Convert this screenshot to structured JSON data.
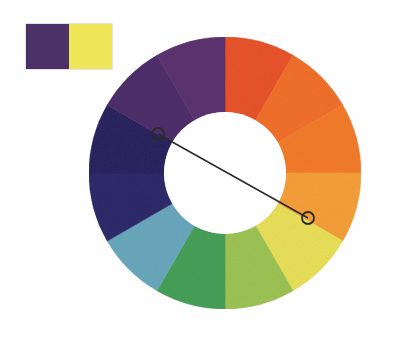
{
  "diagram": {
    "type": "color-wheel-complementary-scheme",
    "background_color": "#fefefe"
  },
  "swatch_pair": {
    "label": "complementary pair swatch",
    "colors": [
      {
        "name": "violet",
        "hex": "#4c3168"
      },
      {
        "name": "yellow",
        "hex": "#efe558"
      }
    ]
  },
  "wheel": {
    "center_x": 139,
    "center_y": 147,
    "outer_radius": 136,
    "inner_radius": 61,
    "segment_count": 12,
    "segments": [
      {
        "index": 0,
        "name": "red-orange",
        "hex": "#e8542a",
        "start_deg": -90,
        "end_deg": -60
      },
      {
        "index": 1,
        "name": "orange",
        "hex": "#f2702c",
        "start_deg": -60,
        "end_deg": -30
      },
      {
        "index": 2,
        "name": "orange-2",
        "hex": "#f47c2c",
        "start_deg": -30,
        "end_deg": 0
      },
      {
        "index": 3,
        "name": "yellow-orange",
        "hex": "#f5a03a",
        "start_deg": 0,
        "end_deg": 30
      },
      {
        "index": 4,
        "name": "yellow",
        "hex": "#e9e05a",
        "start_deg": 30,
        "end_deg": 60
      },
      {
        "index": 5,
        "name": "yellow-green",
        "hex": "#9dc354",
        "start_deg": 60,
        "end_deg": 90
      },
      {
        "index": 6,
        "name": "green",
        "hex": "#46a058",
        "start_deg": 90,
        "end_deg": 120
      },
      {
        "index": 7,
        "name": "blue-green",
        "hex": "#6aa8bd",
        "start_deg": 120,
        "end_deg": 150
      },
      {
        "index": 8,
        "name": "blue",
        "hex": "#2e2a6b",
        "start_deg": 150,
        "end_deg": 180
      },
      {
        "index": 9,
        "name": "blue-violet",
        "hex": "#2c2560",
        "start_deg": 180,
        "end_deg": 210
      },
      {
        "index": 10,
        "name": "violet",
        "hex": "#4e2f6b",
        "start_deg": 210,
        "end_deg": 240
      },
      {
        "index": 11,
        "name": "red-violet",
        "hex": "#5c3370",
        "start_deg": 240,
        "end_deg": 270
      }
    ],
    "hub": {
      "name": "center-hole",
      "hex": "#ffffff"
    }
  },
  "selector": {
    "name": "complementary-selector",
    "line_color": "#2a2a2a",
    "marker_shape": "open-circle",
    "marker_radius": 6,
    "endpoints": [
      {
        "name": "violet-marker",
        "x": 72,
        "y": 108,
        "hue": "violet"
      },
      {
        "name": "yellow-marker",
        "x": 222,
        "y": 192,
        "hue": "yellow"
      }
    ]
  }
}
